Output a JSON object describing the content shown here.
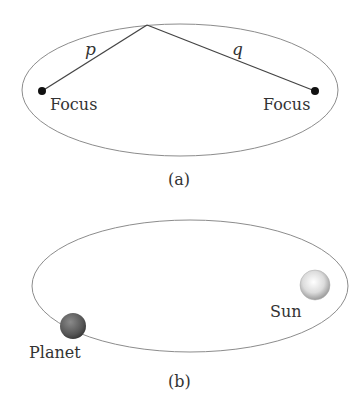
{
  "figure_a": {
    "label": "(a)",
    "left_focus_label": "Focus",
    "right_focus_label": "Focus",
    "line_p_label": "p",
    "line_q_label": "q"
  },
  "figure_b": {
    "label": "(b)",
    "planet_label": "Planet",
    "sun_label": "Sun"
  },
  "colors": {
    "ellipse": "#8c8c8c",
    "line": "#444444",
    "focus_dot": "#111111"
  }
}
